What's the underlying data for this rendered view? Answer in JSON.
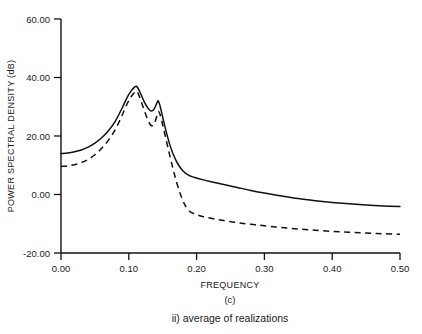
{
  "figure": {
    "panel_label": "(c)",
    "subcaption": "ii) average of realizations"
  },
  "chart_data": {
    "type": "line",
    "title": "",
    "xlabel": "FREQUENCY",
    "ylabel": "POWER SPECTRAL DENSITY (dB)",
    "xlim": [
      0.0,
      0.5
    ],
    "ylim": [
      -20.0,
      60.0
    ],
    "xticks": [
      0.0,
      0.1,
      0.2,
      0.3,
      0.4,
      0.5
    ],
    "xtick_labels": [
      "0.00",
      "0.10",
      "0.20",
      "0.30",
      "0.40",
      "0.50"
    ],
    "yticks": [
      -20.0,
      0.0,
      20.0,
      40.0,
      60.0
    ],
    "ytick_labels": [
      "-20.00",
      "0.00",
      "20.00",
      "40.00",
      "60.00"
    ],
    "grid": false,
    "legend": "none",
    "series": [
      {
        "name": "solid",
        "style": "solid",
        "color": "#111111",
        "x": [
          0.0,
          0.01,
          0.02,
          0.03,
          0.04,
          0.05,
          0.06,
          0.07,
          0.08,
          0.09,
          0.098,
          0.104,
          0.109,
          0.111,
          0.114,
          0.118,
          0.123,
          0.128,
          0.132,
          0.136,
          0.139,
          0.142,
          0.1435,
          0.146,
          0.15,
          0.155,
          0.16,
          0.165,
          0.172,
          0.18,
          0.188,
          0.196,
          0.21,
          0.225,
          0.24,
          0.26,
          0.28,
          0.3,
          0.325,
          0.35,
          0.375,
          0.4,
          0.425,
          0.45,
          0.475,
          0.5
        ],
        "y": [
          14.0,
          14.2,
          14.6,
          15.2,
          16.2,
          17.6,
          19.4,
          21.8,
          25.0,
          29.5,
          33.4,
          35.6,
          36.8,
          37.0,
          36.2,
          34.2,
          31.6,
          29.6,
          28.6,
          28.8,
          30.0,
          31.6,
          32.0,
          30.4,
          26.4,
          21.6,
          17.4,
          14.0,
          10.6,
          8.0,
          6.6,
          5.9,
          5.0,
          4.2,
          3.4,
          2.4,
          1.4,
          0.5,
          -0.5,
          -1.4,
          -2.1,
          -2.7,
          -3.2,
          -3.6,
          -3.9,
          -4.1
        ]
      },
      {
        "name": "dashed",
        "style": "dashed",
        "color": "#111111",
        "x": [
          0.0,
          0.01,
          0.02,
          0.03,
          0.04,
          0.05,
          0.06,
          0.07,
          0.08,
          0.09,
          0.098,
          0.104,
          0.108,
          0.111,
          0.114,
          0.118,
          0.123,
          0.128,
          0.132,
          0.136,
          0.139,
          0.142,
          0.1435,
          0.146,
          0.15,
          0.155,
          0.16,
          0.165,
          0.17,
          0.176,
          0.182,
          0.188,
          0.196,
          0.21,
          0.225,
          0.24,
          0.26,
          0.28,
          0.3,
          0.325,
          0.35,
          0.375,
          0.4,
          0.425,
          0.45,
          0.475,
          0.5
        ],
        "y": [
          9.6,
          9.8,
          10.2,
          10.9,
          12.0,
          13.6,
          15.8,
          18.6,
          22.2,
          27.0,
          31.2,
          33.6,
          34.8,
          35.4,
          34.4,
          32.0,
          28.6,
          25.6,
          23.8,
          23.6,
          25.0,
          27.4,
          28.4,
          27.4,
          23.8,
          18.8,
          13.8,
          9.0,
          4.6,
          0.2,
          -3.2,
          -5.4,
          -6.6,
          -7.6,
          -8.3,
          -8.9,
          -9.6,
          -10.2,
          -10.7,
          -11.3,
          -11.8,
          -12.2,
          -12.6,
          -12.9,
          -13.2,
          -13.4,
          -13.6
        ]
      }
    ]
  }
}
